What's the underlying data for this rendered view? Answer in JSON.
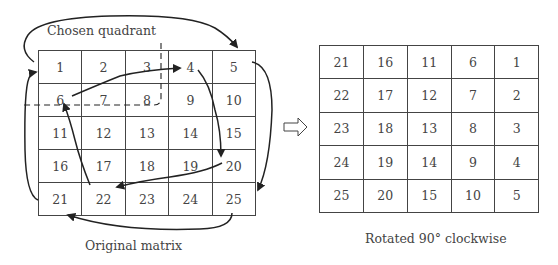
{
  "diagram": {
    "quadrant_label": "Chosen quadrant",
    "left_caption": "Original matrix",
    "right_caption": "Rotated 90° clockwise",
    "transform_arrow": "hollow-right-arrow-icon"
  },
  "original_matrix": {
    "rows": [
      [
        "1",
        "2",
        "3",
        "4",
        "5"
      ],
      [
        "6",
        "7",
        "8",
        "9",
        "10"
      ],
      [
        "11",
        "12",
        "13",
        "14",
        "15"
      ],
      [
        "16",
        "17",
        "18",
        "19",
        "20"
      ],
      [
        "21",
        "22",
        "23",
        "24",
        "25"
      ]
    ]
  },
  "rotated_matrix": {
    "rows": [
      [
        "21",
        "16",
        "11",
        "6",
        "1"
      ],
      [
        "22",
        "17",
        "12",
        "7",
        "2"
      ],
      [
        "23",
        "18",
        "13",
        "8",
        "3"
      ],
      [
        "24",
        "19",
        "14",
        "9",
        "4"
      ],
      [
        "25",
        "20",
        "15",
        "10",
        "5"
      ]
    ]
  },
  "rotation_arrows": {
    "outer_cycle": [
      "1 -> 5",
      "5 -> 25",
      "25 -> 21",
      "21 -> 1"
    ],
    "inner_cycle": [
      "6 -> 4",
      "4 -> 20",
      "20 -> 22",
      "22 -> 6"
    ]
  }
}
